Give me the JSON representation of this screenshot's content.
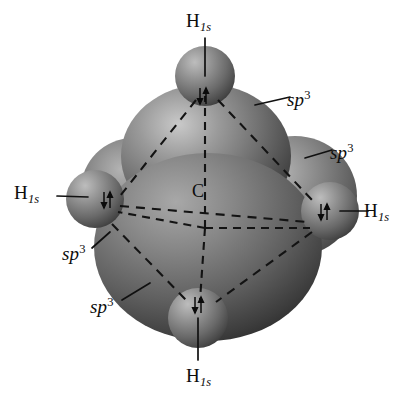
{
  "figure": {
    "background_color": "#ffffff",
    "orbital_color": "#6e6e6e",
    "orbital_color_dark": "#3a3a3a",
    "orbital_color_light": "#b4b4b4",
    "hydrogen_color": "#787878",
    "line_color": "#111111"
  },
  "atoms": {
    "center": {
      "symbol": "C",
      "name": "carbon-center-label"
    },
    "hydrogens": [
      {
        "position": "top",
        "element": "H",
        "orbital": "1s",
        "spin": "pair"
      },
      {
        "position": "left",
        "element": "H",
        "orbital": "1s",
        "spin": "pair"
      },
      {
        "position": "right",
        "element": "H",
        "orbital": "1s",
        "spin": "pair"
      },
      {
        "position": "bottom",
        "element": "H",
        "orbital": "1s",
        "spin": "pair"
      }
    ]
  },
  "labels": {
    "hydrogen": {
      "element": "H",
      "subscript": "1s"
    },
    "hybrid": {
      "base": "sp",
      "superscript": "3"
    },
    "carbon": "C",
    "spin_pair": "↓↑",
    "hybrid_callouts": [
      {
        "id": "sp3-upper-right",
        "base": "sp",
        "superscript": "3"
      },
      {
        "id": "sp3-right",
        "base": "sp",
        "superscript": "3"
      },
      {
        "id": "sp3-left",
        "base": "sp",
        "superscript": "3"
      },
      {
        "id": "sp3-lower-left",
        "base": "sp",
        "superscript": "3"
      }
    ],
    "hydrogen_callouts": [
      {
        "id": "h1s-top",
        "element": "H",
        "subscript": "1s"
      },
      {
        "id": "h1s-left",
        "element": "H",
        "subscript": "1s"
      },
      {
        "id": "h1s-right",
        "element": "H",
        "subscript": "1s"
      },
      {
        "id": "h1s-bottom",
        "element": "H",
        "subscript": "1s"
      }
    ]
  }
}
